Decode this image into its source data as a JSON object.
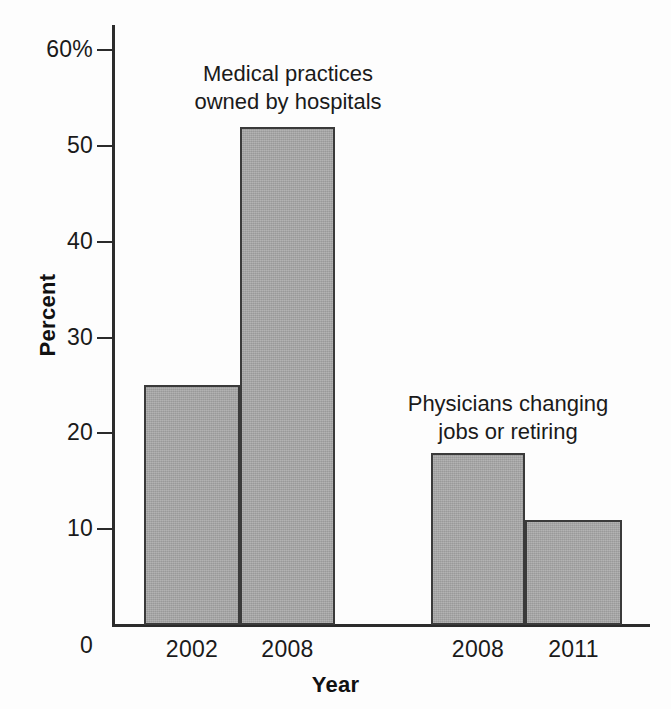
{
  "chart_data": {
    "type": "bar",
    "title": "",
    "xlabel": "Year",
    "ylabel": "Percent",
    "ylim": [
      0,
      60
    ],
    "grid": false,
    "legend_position": "none",
    "categories": [
      "2002",
      "2008",
      "2008",
      "2011"
    ],
    "values": [
      25,
      52,
      18,
      11
    ],
    "yticks": [
      0,
      10,
      20,
      30,
      40,
      50,
      60
    ],
    "ytick_labels": [
      "0",
      "10",
      "20",
      "30",
      "40",
      "50",
      "60%"
    ],
    "bar_color": "#a8a8a8",
    "bar_edge_color": "#3a3a3a",
    "axis_color": "#2b2b2b",
    "groups": [
      {
        "annotation": "Medical practices\nowned by hospitals",
        "categories": [
          "2002",
          "2008"
        ],
        "values": [
          25,
          52
        ]
      },
      {
        "annotation": "Physicians changing\njobs or retiring",
        "categories": [
          "2008",
          "2011"
        ],
        "values": [
          18,
          11
        ]
      }
    ],
    "annotations": [
      "Medical practices\nowned by hospitals",
      "Physicians changing\njobs or retiring"
    ]
  }
}
